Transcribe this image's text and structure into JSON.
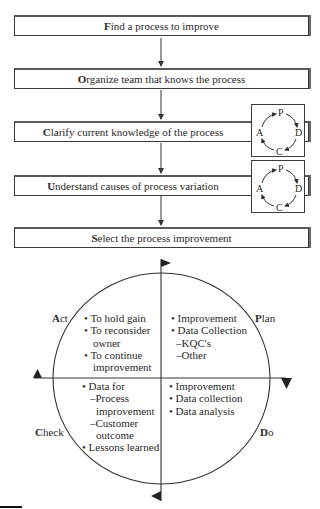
{
  "steps": [
    {
      "initial": "F",
      "rest": "ind a process to improve"
    },
    {
      "initial": "O",
      "rest": "rganize team that knows the process"
    },
    {
      "initial": "C",
      "rest": "larify current knowledge of the process"
    },
    {
      "initial": "U",
      "rest": "nderstand causes of process variation"
    },
    {
      "initial": "S",
      "rest": "elect the process improvement"
    }
  ],
  "mini_cycle": {
    "p": "P",
    "d": "D",
    "c": "C",
    "a": "A"
  },
  "quadrants": {
    "act": {
      "label_initial": "A",
      "label_rest": "ct",
      "items": [
        "• To hold gain",
        "• To reconsider",
        "owner",
        "• To continue",
        "improvement"
      ]
    },
    "plan": {
      "label_initial": "P",
      "label_rest": "lan",
      "items": [
        "• Improvement",
        "• Data Collection",
        "–KQC's",
        "–Other"
      ]
    },
    "check": {
      "label_initial": "C",
      "label_rest": "heck",
      "items": [
        "• Data for",
        "–Process",
        "improvement",
        "–Customer",
        "outcome",
        "• Lessons learned"
      ]
    },
    "do": {
      "label_initial": "D",
      "label_rest": "o",
      "items": [
        "• Improvement",
        "• Data collection",
        "• Data analysis"
      ]
    }
  },
  "colors": {
    "line": "#333333",
    "text": "#2a2a2a",
    "background": "#ffffff"
  }
}
